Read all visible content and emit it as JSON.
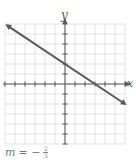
{
  "chart_data": {
    "type": "line",
    "title": "",
    "xlabel": "x",
    "ylabel": "y",
    "xlim": [
      -6,
      6
    ],
    "ylim": [
      -6,
      6
    ],
    "grid": true,
    "series": [
      {
        "name": "line",
        "x": [
          -6,
          6
        ],
        "y": [
          6,
          -2
        ],
        "points_on_line": [
          [
            0,
            2
          ],
          [
            3,
            0
          ]
        ],
        "arrows": "both"
      }
    ],
    "annotation": "m = -2/3",
    "slope": {
      "numerator": "2",
      "denominator": "3",
      "sign": "-"
    }
  },
  "labels": {
    "x_axis": "x",
    "y_axis": "y",
    "slope_var": "m",
    "slope_eq": "= −",
    "slope_num": "2",
    "slope_den": "3"
  },
  "colors": {
    "grid": "#dcdcdc",
    "axis": "#555555",
    "line": "#5a5a5a"
  }
}
